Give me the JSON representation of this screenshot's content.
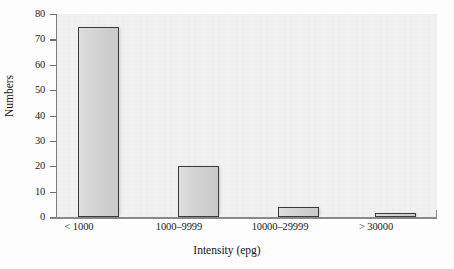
{
  "chart_data": {
    "type": "bar",
    "title": "",
    "subtitle": "",
    "categories": [
      "< 1000",
      "1000–9999",
      "10000–29999",
      "> 30000"
    ],
    "values": [
      75,
      20,
      4,
      1.5
    ],
    "xlabel": "Intensity (epg)",
    "ylabel": "Numbers",
    "ylim": [
      0,
      80
    ],
    "yticks": [
      0,
      10,
      20,
      30,
      40,
      50,
      60,
      70,
      80
    ],
    "ytick_labels": [
      "0",
      "10",
      "20",
      "30",
      "40",
      "50",
      "60",
      "70",
      "80"
    ],
    "grid": false,
    "legend": null,
    "annotations": [],
    "series": [
      {
        "name": "Numbers",
        "values": [
          75,
          20,
          4,
          1.5
        ]
      }
    ],
    "colors": {
      "bar_fill": "#d0d0d0",
      "bar_edge": "#3b3b3b",
      "plot_background": "#f2f2f2",
      "figure_background": "#fdfdfd",
      "axis": "#8a8a8a",
      "text": "#1a1a1a"
    }
  }
}
